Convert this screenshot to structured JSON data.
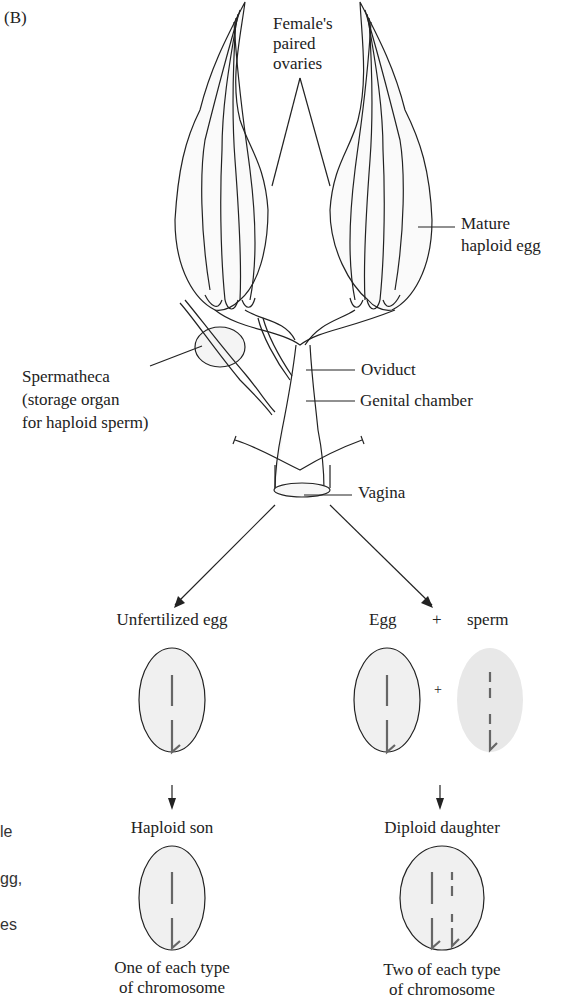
{
  "figure": {
    "panel_label": "(B)",
    "anatomy_labels": {
      "ovaries": [
        "Female's",
        "paired",
        "ovaries"
      ],
      "mature_egg": [
        "Mature",
        "haploid egg"
      ],
      "spermatheca": [
        "Spermatheca",
        "(storage organ",
        "for haploid sperm)"
      ],
      "oviduct": "Oviduct",
      "genital_chamber": "Genital chamber",
      "vagina": "Vagina"
    },
    "left_branch": {
      "title": "Unfertilized egg",
      "offspring": "Haploid son",
      "caption": [
        "One of each type",
        "of chromosome"
      ]
    },
    "right_branch": {
      "egg_label": "Egg",
      "plus_label": "+",
      "sperm_label": "sperm",
      "offspring": "Diploid daughter",
      "caption": [
        "Two of each type",
        "of chromosome"
      ]
    },
    "cut_off_side_text": [
      "le",
      "gg,",
      "es"
    ],
    "colors": {
      "line": "#222222",
      "egg_fill": "#f0f0f0",
      "sperm_fill": "#e8e8e8",
      "chromosome": "#666666"
    }
  }
}
